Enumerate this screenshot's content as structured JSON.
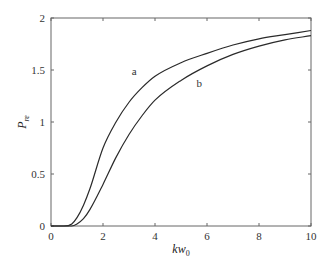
{
  "chart_data": {
    "type": "line",
    "title": "",
    "xlabel": "kw0",
    "xlabel_main": "kw",
    "xlabel_sub": "0",
    "ylabel": "Pre",
    "ylabel_main": "P",
    "ylabel_sub": "re",
    "xlim": [
      0,
      10
    ],
    "ylim": [
      0,
      2
    ],
    "xticks": [
      0,
      2,
      4,
      6,
      8,
      10
    ],
    "yticks": [
      0,
      0.5,
      1,
      1.5,
      2
    ],
    "xtick_labels": [
      "0",
      "2",
      "4",
      "6",
      "8",
      "10"
    ],
    "ytick_labels": [
      "0",
      "0.5",
      "1",
      "1.5",
      "2"
    ],
    "grid": false,
    "legend": "none (inline curve labels)",
    "x": [
      0,
      0.5,
      0.8,
      1.0,
      1.25,
      1.5,
      2,
      2.5,
      3,
      3.5,
      4,
      5,
      6,
      7,
      8,
      9,
      10
    ],
    "series": [
      {
        "name": "a",
        "values": [
          0,
          0,
          0.02,
          0.08,
          0.2,
          0.36,
          0.75,
          1.0,
          1.19,
          1.33,
          1.44,
          1.57,
          1.66,
          1.74,
          1.8,
          1.84,
          1.88
        ],
        "label_pos": [
          3.2,
          1.45
        ]
      },
      {
        "name": "b",
        "values": [
          0,
          0,
          0,
          0.02,
          0.07,
          0.16,
          0.4,
          0.66,
          0.88,
          1.06,
          1.21,
          1.4,
          1.54,
          1.65,
          1.73,
          1.79,
          1.83
        ],
        "label_pos": [
          5.7,
          1.34
        ]
      }
    ],
    "colors": {
      "line": "#2a2a2a",
      "axis": "#555555"
    }
  }
}
